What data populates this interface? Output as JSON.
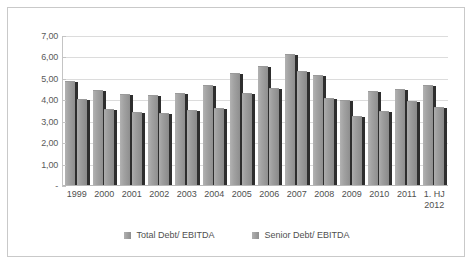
{
  "chart_data": {
    "type": "bar",
    "title": "",
    "xlabel": "",
    "ylabel": "",
    "ylim": [
      0,
      7
    ],
    "ytick_labels": [
      "7,00",
      "6,00",
      "5,00",
      "4,00",
      "3,00",
      "2,00",
      "1,00",
      "-"
    ],
    "ytick_values": [
      7,
      6,
      5,
      4,
      3,
      2,
      1,
      0
    ],
    "grid": true,
    "legend_position": "bottom",
    "categories": [
      "1999",
      "2000",
      "2001",
      "2002",
      "2003",
      "2004",
      "2005",
      "2006",
      "2007",
      "2008",
      "2009",
      "2010",
      "2011",
      "1. HJ\n2012"
    ],
    "series": [
      {
        "name": "Total Debt/ EBITDA",
        "color": "#9e9e9e",
        "values": [
          4.85,
          4.45,
          4.25,
          4.2,
          4.3,
          4.65,
          5.25,
          5.55,
          6.1,
          5.15,
          3.95,
          4.4,
          4.5,
          4.65
        ]
      },
      {
        "name": "Senior Debt/ EBITDA",
        "color": "#9e9e9e",
        "values": [
          4.0,
          3.55,
          3.4,
          3.35,
          3.5,
          3.6,
          4.3,
          4.55,
          5.3,
          4.05,
          3.2,
          3.45,
          3.9,
          3.65
        ]
      }
    ]
  },
  "legend": {
    "items": [
      {
        "label": "Total Debt/ EBITDA"
      },
      {
        "label": "Senior Debt/ EBITDA"
      }
    ]
  }
}
